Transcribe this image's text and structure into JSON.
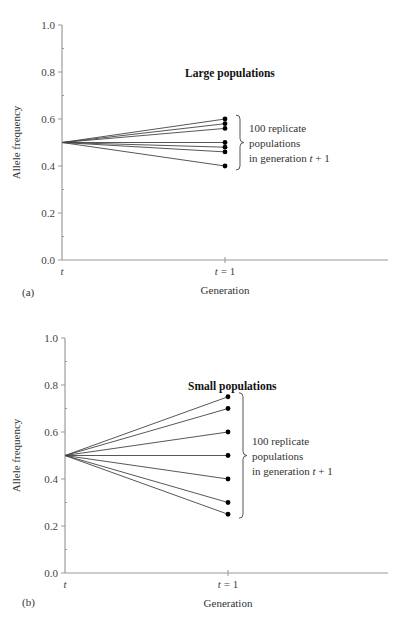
{
  "chart_data": [
    {
      "type": "line",
      "panel": "(a)",
      "title": "Large populations",
      "xlabel": "Generation",
      "ylabel": "Allele frequency",
      "x_ticks": [
        "t",
        "t = 1"
      ],
      "y_ticks": [
        "0.0",
        "0.2",
        "0.4",
        "0.6",
        "0.8",
        "1.0"
      ],
      "ylim": [
        0,
        1
      ],
      "start_value": 0.5,
      "end_values": [
        0.6,
        0.58,
        0.56,
        0.5,
        0.48,
        0.46,
        0.4
      ],
      "annotation": [
        "100 replicate",
        "populations",
        "in generation t + 1"
      ]
    },
    {
      "type": "line",
      "panel": "(b)",
      "title": "Small populations",
      "xlabel": "Generation",
      "ylabel": "Allele frequency",
      "x_ticks": [
        "t",
        "t = 1"
      ],
      "y_ticks": [
        "0.0",
        "0.2",
        "0.4",
        "0.6",
        "0.8",
        "1.0"
      ],
      "ylim": [
        0,
        1
      ],
      "start_value": 0.5,
      "end_values": [
        0.75,
        0.7,
        0.6,
        0.5,
        0.4,
        0.3,
        0.25
      ],
      "annotation": [
        "100 replicate",
        "populations",
        "in generation t + 1"
      ]
    }
  ],
  "panels": [
    {
      "label": "(a)",
      "title": "Large populations",
      "ylabel": "Allele frequency",
      "xlabel": "Generation",
      "x_tick_start": "t",
      "x_tick_end": "t = 1",
      "annot_line1": "100 replicate",
      "annot_line2": "populations",
      "annot_line3": "in generation t + 1"
    },
    {
      "label": "(b)",
      "title": "Small populations",
      "ylabel": "Allele frequency",
      "xlabel": "Generation",
      "x_tick_start": "t",
      "x_tick_end": "t = 1",
      "annot_line1": "100 replicate",
      "annot_line2": "populations",
      "annot_line3": "in generation t + 1"
    }
  ],
  "y_tick_labels": [
    "0.0",
    "0.2",
    "0.4",
    "0.6",
    "0.8",
    "1.0"
  ]
}
